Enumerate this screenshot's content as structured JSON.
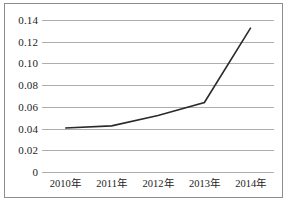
{
  "chart_data": {
    "type": "line",
    "title": "",
    "subtitle": "",
    "xlabel": "",
    "ylabel": "",
    "categories": [
      "2010年",
      "2011年",
      "2012年",
      "2013年",
      "2014年"
    ],
    "series": [
      {
        "name": "",
        "values": [
          0.0405,
          0.0425,
          0.052,
          0.064,
          0.133
        ]
      }
    ],
    "ylim": [
      0,
      0.14
    ],
    "ytick_values": [
      0,
      0.02,
      0.04,
      0.06,
      0.08,
      0.1,
      0.12,
      0.14
    ],
    "ytick_labels": [
      "0",
      "0.02",
      "0.04",
      "0.06",
      "0.08",
      "0.10",
      "0.12",
      "0.14"
    ],
    "grid": {
      "horizontal": true,
      "vertical": false
    },
    "legend": {
      "visible": false,
      "position": "none"
    },
    "markers": false,
    "colors": {
      "line": "#2a2a2a",
      "gridline": "#aeaeae",
      "frame": "#8d8d8d",
      "text": "#1c1c1c",
      "background": "#ffffff"
    }
  }
}
